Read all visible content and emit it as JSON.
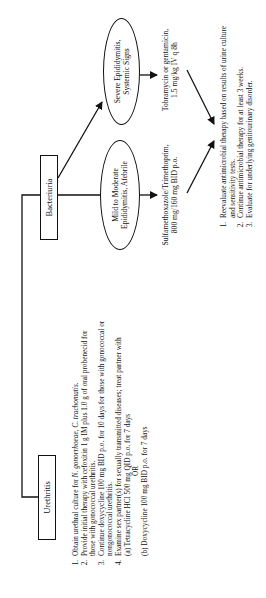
{
  "nodes": {
    "urethritis": "Urethritis",
    "bacteriuria": "Bacteriuria",
    "mild": {
      "line1": "Mild to Moderate",
      "line2": "Epididymitis, Afebrile"
    },
    "severe": {
      "line1": "Severe Epididymitis,",
      "line2": "Systemic Signs"
    }
  },
  "treatments": {
    "mild": {
      "line1": "Sulfamethoxazole/Trimethoprim,",
      "line2": "800 mg/160 mg BID p.o."
    },
    "severe": {
      "line1": "Tobramycin or gentamicin,",
      "line2": "1.5 mg/kg IV q 8h"
    }
  },
  "urethritis_steps": {
    "s1_pre": "Obtain urethral culture for ",
    "s1_org1": "N. gonorrhoeae, C. trachomatis.",
    "s2": "Provide initial therapy with cefoxitin 1 g IM plus 1.0 g of oral probenecid for those with gonococcal urethritis.",
    "s3": "Continue doxycycline 100 mg BID p.o. for 10 days for those with gonococcal or nongonococcal urethritis.",
    "s4": "Examine sex partner(s) for sexually transmitted diseases; treat partner with",
    "s4a": "(a) Tetracycline HCl 500 mg QID p.o. for 7 days",
    "or": "OR",
    "s4b": "(b) Doxycycline 100 mg BID p.o. for 7 days"
  },
  "final_steps": [
    "Reevaluate antimicrobial therapy based on results of urine culture and sensitivity tests.",
    "Continue antimicrobial therapy for at least 3 weeks.",
    "Evaluate for underlying genitourinary disorder."
  ],
  "colors": {
    "line": "#111111",
    "background": "#ffffff"
  }
}
